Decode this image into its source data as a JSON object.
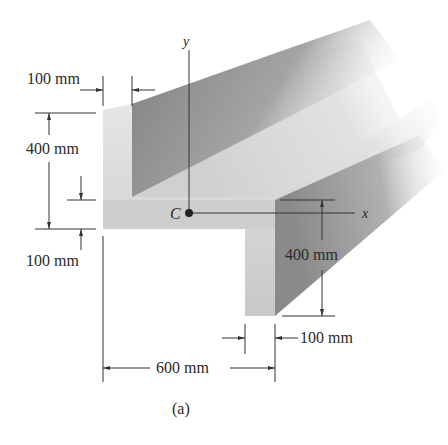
{
  "figure": {
    "caption": "(a)",
    "axes": {
      "x_label": "x",
      "y_label": "y",
      "centroid_label": "C"
    },
    "dimensions": {
      "top_flange_thickness": "100 mm",
      "left_height": "400 mm",
      "bottom_flange_thickness": "100 mm",
      "right_leg_height": "400 mm",
      "right_leg_thickness": "100 mm",
      "overall_width": "600 mm"
    }
  },
  "colors": {
    "light_face": "#d9d9d9",
    "mid_face": "#bdbdbd",
    "dark_face": "#8c8c8c",
    "line": "#333333"
  }
}
